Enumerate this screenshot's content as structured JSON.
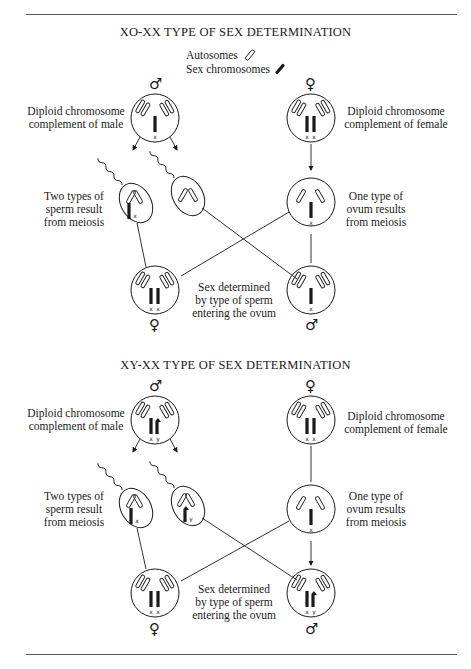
{
  "diagrams": [
    {
      "title": "XO-XX TYPE OF SEX DETERMINATION",
      "legend": {
        "autosomes": "Autosomes",
        "sex_chromosomes": "Sex chromosomes"
      },
      "male_parent": {
        "symbol": "♂",
        "label_line1": "Diploid chromosome",
        "label_line2": "complement of male",
        "sex_chromosomes": "x"
      },
      "female_parent": {
        "symbol": "♀",
        "label_line1": "Diploid chromosome",
        "label_line2": "complement of female",
        "sex_chromosomes": "x x"
      },
      "sperm_label": {
        "line1": "Two types of",
        "line2": "sperm result",
        "line3": "from meiosis"
      },
      "sperm": [
        {
          "sex_chromosome": "x"
        },
        {
          "sex_chromosome": ""
        }
      ],
      "ovum_label": {
        "line1": "One type of",
        "line2": "ovum results",
        "line3": "from meiosis"
      },
      "ovum": {
        "sex_chromosome": "x"
      },
      "offspring_label": {
        "line1": "Sex determined",
        "line2": "by type of sperm",
        "line3": "entering the ovum"
      },
      "offspring": [
        {
          "symbol": "♀",
          "sex_chromosomes": "x x"
        },
        {
          "symbol": "♂",
          "sex_chromosomes": "x"
        }
      ]
    },
    {
      "title": "XY-XX TYPE OF SEX DETERMINATION",
      "male_parent": {
        "symbol": "♂",
        "label_line1": "Diploid chromosome",
        "label_line2": "complement of male",
        "sex_chromosomes": "x y"
      },
      "female_parent": {
        "symbol": "♀",
        "label_line1": "Diploid chromosome",
        "label_line2": "complement of female",
        "sex_chromosomes": "x x"
      },
      "sperm_label": {
        "line1": "Two types of",
        "line2": "sperm result",
        "line3": "from meiosis"
      },
      "sperm": [
        {
          "sex_chromosome": "x"
        },
        {
          "sex_chromosome": "y"
        }
      ],
      "ovum_label": {
        "line1": "One type of",
        "line2": "ovum results",
        "line3": "from meiosis"
      },
      "ovum": {
        "sex_chromosome": "x"
      },
      "offspring_label": {
        "line1": "Sex determined",
        "line2": "by type of sperm",
        "line3": "entering the ovum"
      },
      "offspring": [
        {
          "symbol": "♀",
          "sex_chromosomes": "x x"
        },
        {
          "symbol": "♂",
          "sex_chromosomes": "x y"
        }
      ]
    }
  ],
  "colors": {
    "ink": "#1a1a1a",
    "rule": "#555555",
    "background": "#ffffff"
  }
}
